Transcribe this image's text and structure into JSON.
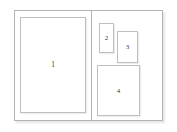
{
  "diagram": {
    "page_background": "#ffffff",
    "border_color": "#b4b4b4",
    "block_border_color": "#bfbfbf",
    "label_color": "#3c3c3c",
    "spread": {
      "left_page": {
        "name": "left-page",
        "blocks": [
          {
            "id": "1",
            "label": "1",
            "shape": "rectangle",
            "orientation": "portrait"
          }
        ]
      },
      "right_page": {
        "name": "right-page",
        "blocks": [
          {
            "id": "2",
            "label": "2",
            "shape": "rectangle",
            "orientation": "portrait"
          },
          {
            "id": "3",
            "label": "3",
            "shape": "rectangle",
            "orientation": "portrait"
          },
          {
            "id": "4",
            "label": "4",
            "shape": "rectangle",
            "orientation": "portrait"
          }
        ]
      }
    }
  }
}
